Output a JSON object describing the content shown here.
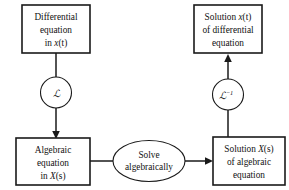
{
  "diagram": {
    "colors": {
      "stroke": "#1a1a1a",
      "fill": "#ffffff",
      "text": "#111111"
    },
    "nodes": {
      "differential_equation": {
        "name": "Differential equation in x(t)",
        "lines": [
          "Differential",
          "equation",
          "in "
        ],
        "variable": "x",
        "argument": "(t)",
        "shape": "rectangle"
      },
      "solution_xt": {
        "name": "Solution x(t) of differential equation",
        "line1_prefix": "Solution ",
        "line1_variable": "x",
        "line1_argument": "(t)",
        "lines": [
          "of differential",
          "equation"
        ],
        "shape": "rectangle"
      },
      "algebraic_equation": {
        "name": "Algebraic equation in X(s)",
        "lines": [
          "Algebraic",
          "equation",
          "in "
        ],
        "variable": "X",
        "argument": "(s)",
        "shape": "rectangle"
      },
      "solution_Xs": {
        "name": "Solution X(s) of algebraic equation",
        "line1_prefix": "Solution ",
        "line1_variable": "X",
        "line1_argument": "(s)",
        "lines": [
          "of algebraic",
          "equation"
        ],
        "shape": "rectangle"
      },
      "laplace_transform": {
        "name": "Laplace transform operator",
        "symbol": "ℒ",
        "exponent": "",
        "shape": "circle"
      },
      "inverse_laplace_transform": {
        "name": "Inverse Laplace transform operator",
        "symbol": "ℒ",
        "exponent": "−1",
        "shape": "circle"
      },
      "solve_algebraically": {
        "name": "Solve algebraically",
        "lines": [
          "Solve",
          "algebraically"
        ],
        "shape": "ellipse"
      }
    },
    "edges": [
      {
        "name": "differential-to-laplace",
        "from": "differential_equation",
        "to": "laplace_transform",
        "arrow": false
      },
      {
        "name": "laplace-to-algebraic",
        "from": "laplace_transform",
        "to": "algebraic_equation",
        "arrow": true,
        "direction": "down"
      },
      {
        "name": "algebraic-to-solve",
        "from": "algebraic_equation",
        "to": "solve_algebraically",
        "arrow": false
      },
      {
        "name": "solve-to-solution-Xs",
        "from": "solve_algebraically",
        "to": "solution_Xs",
        "arrow": true,
        "direction": "right"
      },
      {
        "name": "solution-Xs-to-inverse-laplace",
        "from": "solution_Xs",
        "to": "inverse_laplace_transform",
        "arrow": false
      },
      {
        "name": "inverse-laplace-to-solution-xt",
        "from": "inverse_laplace_transform",
        "to": "solution_xt",
        "arrow": true,
        "direction": "up"
      }
    ]
  }
}
